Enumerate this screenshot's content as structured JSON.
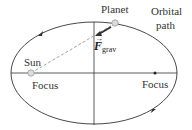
{
  "labels": {
    "planet": "Planet",
    "orbital_path_line1": "Orbital",
    "orbital_path_line2": "path",
    "sun": "Sun",
    "focus_left": "Focus",
    "focus_right": "Focus",
    "force_symbol": "F",
    "force_subscript": "grav"
  },
  "colors": {
    "ellipse": "#333333",
    "axes": "#333333",
    "dashed_line": "#999999",
    "body_fill": "#dddddd",
    "force_arrow": "#333333"
  }
}
